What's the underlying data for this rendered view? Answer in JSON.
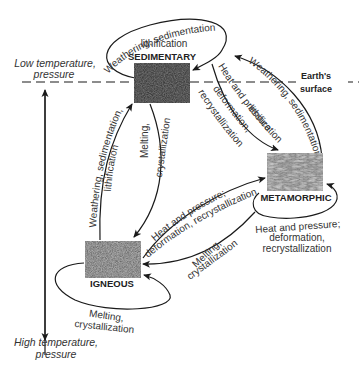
{
  "diagram": {
    "axis": {
      "top_label_line1": "Low temperature,",
      "top_label_line2": "pressure",
      "bottom_label_line1": "High temperature,",
      "bottom_label_line2": "pressure"
    },
    "surface": {
      "label_line1": "Earth's",
      "label_line2": "surface"
    },
    "nodes": {
      "sedimentary": {
        "label": "SEDIMENTARY",
        "color": "#3a3a3a"
      },
      "metamorphic": {
        "label": "METAMORPHIC",
        "color": "#5a5a5a"
      },
      "igneous": {
        "label": "IGNEOUS",
        "color": "#2a2a2a"
      }
    },
    "edges": {
      "sed_loop": {
        "line1": "Weathering, sedimentation",
        "line2": "lithification"
      },
      "sed_to_meta": {
        "line1": "Heat and pressure",
        "line2": "deformation,",
        "line3": "recrystallization"
      },
      "meta_to_sed": {
        "line1": "Weathering, sedimentation",
        "line2": "lithification"
      },
      "sed_to_ign": {
        "line1": "Melting,",
        "line2": "crystallization"
      },
      "ign_to_sed": {
        "line1": "Weathering, sedimentation,",
        "line2": "lithification"
      },
      "ign_to_meta": {
        "line1": "Heat and pressure;",
        "line2": "deformation, recrystallization"
      },
      "meta_to_ign": {
        "line1": "Melting,",
        "line2": "crystallization"
      },
      "meta_loop": {
        "line1": "Heat and pressure;",
        "line2": "deformation,",
        "line3": "recrystallization"
      },
      "ign_loop": {
        "line1": "Melting,",
        "line2": "crystallization"
      }
    }
  }
}
